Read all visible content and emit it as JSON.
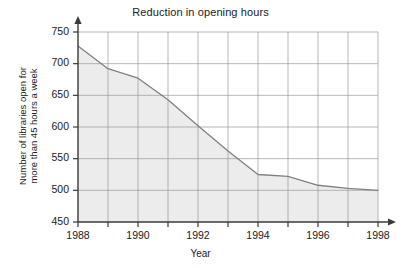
{
  "chart_data": {
    "type": "area",
    "title": "Reduction in opening hours",
    "xlabel": "Year",
    "ylabel": "Number of libraries open for\nmore than 45 hours a week",
    "x": [
      1988,
      1989,
      1990,
      1991,
      1992,
      1993,
      1994,
      1995,
      1996,
      1997,
      1998
    ],
    "values": [
      728,
      692,
      677,
      643,
      602,
      562,
      525,
      522,
      508,
      503,
      500
    ],
    "series": [
      {
        "name": "Libraries open more than 45 hours a week",
        "values": [
          728,
          692,
          677,
          643,
          602,
          562,
          525,
          522,
          508,
          503,
          500
        ]
      }
    ],
    "xlim": [
      1988,
      1998
    ],
    "ylim": [
      450,
      750
    ],
    "y_ticks": [
      450,
      500,
      550,
      600,
      650,
      700,
      750
    ],
    "y_tick_labels": [
      "450",
      "500",
      "550",
      "600",
      "650",
      "700",
      "750"
    ],
    "x_ticks": [
      1988,
      1989,
      1990,
      1991,
      1992,
      1993,
      1994,
      1995,
      1996,
      1997,
      1998
    ],
    "x_tick_labels_shown": [
      "1988",
      "1990",
      "1992",
      "1994",
      "1996",
      "1998"
    ],
    "x_labeled_ticks": [
      1988,
      1990,
      1992,
      1994,
      1996,
      1998
    ],
    "grid": true,
    "legend": false,
    "legend_position": "none",
    "line_color": "#808080",
    "fill_color": "#ececec",
    "grid_color": "#9a9a9a",
    "axis_color": "#3a3a3a",
    "background_color": "#ffffff",
    "annotations": []
  },
  "axes": {
    "x_arrow": true,
    "y_arrow": true
  }
}
